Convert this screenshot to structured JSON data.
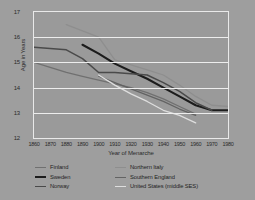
{
  "figure": {
    "background_color": "#9e9e9e",
    "plot_background_color": "#9a9a9a",
    "grid_color": "#ededed",
    "frame_color": "#e9e9e9"
  },
  "chart_data": {
    "type": "line",
    "title": "",
    "xlabel": "Year of Menarche",
    "ylabel": "Age in Years",
    "xlim": [
      1860,
      1980
    ],
    "ylim": [
      12,
      17
    ],
    "grid": true,
    "legend_position": "below-axes",
    "xticks": [
      1860,
      1870,
      1880,
      1890,
      1900,
      1910,
      1920,
      1930,
      1940,
      1950,
      1960,
      1970,
      1980
    ],
    "yticks": [
      12,
      13,
      14,
      15,
      16,
      17
    ],
    "xtick_labels": [
      "1860",
      "1870",
      "1880",
      "1890",
      "1900",
      "1910",
      "1920",
      "1930",
      "1940",
      "1950",
      "1960",
      "1970",
      "1980"
    ],
    "ytick_labels": [
      "12",
      "13",
      "14",
      "15",
      "16",
      "17"
    ],
    "series": [
      {
        "name": "Finland",
        "color": "#707070",
        "width": 1.3,
        "x": [
          1860,
          1870,
          1880,
          1890,
          1900,
          1910,
          1920,
          1930,
          1940,
          1950,
          1960
        ],
        "y": [
          15.0,
          14.8,
          14.6,
          14.45,
          14.3,
          14.15,
          14.0,
          13.8,
          13.55,
          13.25,
          12.95
        ]
      },
      {
        "name": "Sweden",
        "color": "#1c1c1c",
        "width": 2.1,
        "x": [
          1890,
          1900,
          1910,
          1920,
          1930,
          1940,
          1950,
          1960,
          1970,
          1980
        ],
        "y": [
          15.7,
          15.35,
          14.95,
          14.65,
          14.35,
          14.0,
          13.65,
          13.3,
          13.1,
          13.1
        ]
      },
      {
        "name": "Norway",
        "color": "#4a4a4a",
        "width": 1.5,
        "x": [
          1860,
          1870,
          1880,
          1890,
          1900,
          1910,
          1920,
          1930,
          1940,
          1950,
          1960,
          1970
        ],
        "y": [
          15.6,
          15.55,
          15.5,
          15.15,
          14.6,
          14.6,
          14.55,
          14.5,
          14.2,
          13.85,
          13.4,
          13.1
        ]
      },
      {
        "name": "Northern Italy",
        "color": "#8e8e8e",
        "width": 1.3,
        "x": [
          1880,
          1890,
          1900,
          1910,
          1920,
          1930,
          1940,
          1950,
          1960,
          1970,
          1980
        ],
        "y": [
          16.5,
          16.25,
          16.0,
          15.1,
          14.9,
          14.7,
          14.5,
          14.1,
          13.65,
          13.3,
          13.25
        ]
      },
      {
        "name": "Southern England",
        "color": "#636363",
        "width": 1.3,
        "x": [
          1900,
          1910,
          1920,
          1930,
          1940,
          1950,
          1960
        ],
        "y": [
          14.45,
          14.2,
          13.95,
          13.7,
          13.45,
          13.15,
          12.9
        ]
      },
      {
        "name": "United States (middle SES)",
        "color": "#dedede",
        "width": 1.3,
        "x": [
          1900,
          1910,
          1920,
          1930,
          1940,
          1950,
          1960
        ],
        "y": [
          14.5,
          14.1,
          13.75,
          13.45,
          13.1,
          12.9,
          12.6
        ]
      }
    ]
  },
  "legend": {
    "columns": [
      {
        "items": [
          {
            "label": "Finland",
            "color": "#707070",
            "width": 1.3
          },
          {
            "label": "Sweden",
            "color": "#1c1c1c",
            "width": 2.4
          },
          {
            "label": "Norway",
            "color": "#4a4a4a",
            "width": 1.5
          }
        ]
      },
      {
        "items": [
          {
            "label": "Northern Italy",
            "color": "#8e8e8e",
            "width": 1.3
          },
          {
            "label": "Southern England",
            "color": "#636363",
            "width": 1.3
          },
          {
            "label": "United States (middle SES)",
            "color": "#dedede",
            "width": 1.3
          }
        ]
      }
    ]
  }
}
